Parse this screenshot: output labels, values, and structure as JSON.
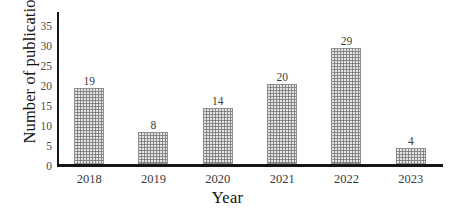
{
  "chart_data": {
    "type": "bar",
    "title": "",
    "categories": [
      "2018",
      "2019",
      "2020",
      "2021",
      "2022",
      "2023"
    ],
    "values": [
      19,
      8,
      14,
      20,
      29,
      4
    ],
    "xlabel": "Year",
    "ylabel": "Number of publications",
    "ylim": [
      0,
      38
    ],
    "yticks": [
      0,
      5,
      10,
      15,
      20,
      25,
      30,
      35
    ],
    "ytick_labels": [
      "0",
      "5",
      "10",
      "15",
      "20",
      "25",
      "30",
      "35"
    ],
    "value_labels": [
      "19",
      "8",
      "14",
      "20",
      "29",
      "4"
    ],
    "grid": false,
    "legend": null,
    "bar_color": "#9a9a9a",
    "bar_pattern": "fine-dotted-stipple",
    "axis_color": "#161616"
  },
  "axes": {
    "y_title": "Number of publications",
    "x_title": "Year"
  }
}
